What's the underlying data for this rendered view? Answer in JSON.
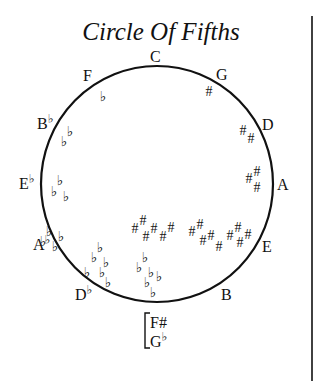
{
  "diagram": {
    "title": "Circle Of Fifths",
    "colors": {
      "ink": "#111111",
      "background": "#ffffff"
    },
    "circle": {
      "cx": 157,
      "cy": 184,
      "rx": 116,
      "ry": 118
    },
    "divider_line": {
      "x": 312,
      "y1": 16,
      "y2": 381
    },
    "keys": [
      {
        "id": "C",
        "letter": "C",
        "accidental": "",
        "x": 150,
        "y": 62
      },
      {
        "id": "G",
        "letter": "G",
        "accidental": "",
        "x": 216,
        "y": 80
      },
      {
        "id": "D",
        "letter": "D",
        "accidental": "",
        "x": 262,
        "y": 130
      },
      {
        "id": "A",
        "letter": "A",
        "accidental": "",
        "x": 277,
        "y": 190
      },
      {
        "id": "E",
        "letter": "E",
        "accidental": "",
        "x": 262,
        "y": 252
      },
      {
        "id": "B",
        "letter": "B",
        "accidental": "",
        "x": 221,
        "y": 300
      },
      {
        "id": "F",
        "letter": "F",
        "accidental": "",
        "x": 83,
        "y": 81
      },
      {
        "id": "Bb",
        "letter": "B",
        "accidental": "♭",
        "x": 37,
        "y": 129
      },
      {
        "id": "Eb",
        "letter": "E",
        "accidental": "♭",
        "x": 19,
        "y": 189
      },
      {
        "id": "Ab",
        "letter": "A",
        "accidental": "♭",
        "x": 33,
        "y": 250
      },
      {
        "id": "Db",
        "letter": "D",
        "accidental": "♭",
        "x": 75,
        "y": 300
      }
    ],
    "enharmonic": {
      "top": "F#",
      "bottom_letter": "G",
      "bottom_accidental": "♭",
      "bracket": {
        "x": 145,
        "y1": 313,
        "y2": 348
      }
    },
    "signatures": [
      {
        "key": "F",
        "symbol": "♭",
        "marks": [
          [
            103,
            101
          ]
        ]
      },
      {
        "key": "Bb",
        "symbol": "♭",
        "marks": [
          [
            64,
            146
          ],
          [
            70,
            136
          ]
        ]
      },
      {
        "key": "Eb",
        "symbol": "♭",
        "marks": [
          [
            54,
            196
          ],
          [
            60,
            185
          ],
          [
            66,
            201
          ]
        ]
      },
      {
        "key": "Ab",
        "symbol": "♭",
        "marks": [
          [
            43,
            246
          ],
          [
            49,
            236
          ],
          [
            55,
            251
          ],
          [
            61,
            241
          ]
        ]
      },
      {
        "key": "Db",
        "symbol": "♭",
        "marks": [
          [
            94,
            262
          ],
          [
            100,
            252
          ],
          [
            106,
            267
          ],
          [
            102,
            277
          ],
          [
            108,
            287
          ],
          [
            87,
            277
          ]
        ]
      },
      {
        "key": "Gb",
        "symbol": "♭",
        "marks": [
          [
            139,
            272
          ],
          [
            145,
            262
          ],
          [
            151,
            277
          ],
          [
            147,
            287
          ],
          [
            153,
            297
          ],
          [
            159,
            281
          ]
        ]
      },
      {
        "key": "G",
        "symbol": "#",
        "marks": [
          [
            209,
            96
          ]
        ]
      },
      {
        "key": "D",
        "symbol": "#",
        "marks": [
          [
            243,
            135
          ],
          [
            251,
            143
          ]
        ]
      },
      {
        "key": "A",
        "symbol": "#",
        "marks": [
          [
            249,
            183
          ],
          [
            257,
            176
          ],
          [
            257,
            192
          ]
        ]
      },
      {
        "key": "E",
        "symbol": "#",
        "marks": [
          [
            230,
            240
          ],
          [
            238,
            232
          ],
          [
            240,
            247
          ],
          [
            248,
            239
          ]
        ]
      },
      {
        "key": "B",
        "symbol": "#",
        "marks": [
          [
            192,
            236
          ],
          [
            200,
            229
          ],
          [
            203,
            245
          ],
          [
            211,
            240
          ],
          [
            219,
            251
          ]
        ]
      },
      {
        "key": "F#",
        "symbol": "#",
        "marks": [
          [
            135,
            233
          ],
          [
            143,
            225
          ],
          [
            146,
            241
          ],
          [
            154,
            233
          ],
          [
            163,
            241
          ],
          [
            171,
            232
          ]
        ]
      }
    ]
  }
}
